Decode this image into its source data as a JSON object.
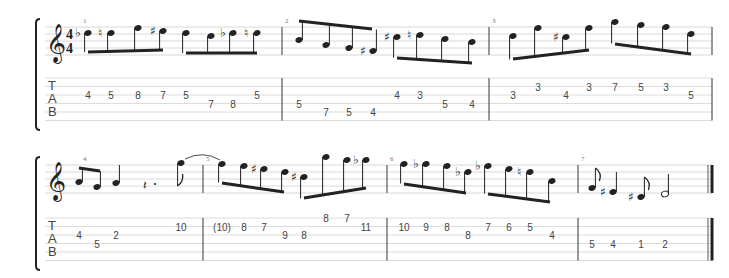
{
  "score": {
    "time_signature": {
      "top": "4",
      "bottom": "4"
    },
    "clef": "treble-clef",
    "tab_label": [
      "T",
      "A",
      "B"
    ],
    "systems": [
      {
        "measures": [
          {
            "number": "1",
            "tab": [
              {
                "fret": "4",
                "string": 2
              },
              {
                "fret": "5",
                "string": 2
              },
              {
                "fret": "8",
                "string": 2
              },
              {
                "fret": "7",
                "string": 2
              },
              {
                "fret": "5",
                "string": 2
              },
              {
                "fret": "7",
                "string": 3
              },
              {
                "fret": "8",
                "string": 3
              },
              {
                "fret": "5",
                "string": 2
              }
            ],
            "accidentals": [
              "♭",
              "♮",
              "",
              "♯",
              "",
              "",
              "♭",
              "♮"
            ]
          },
          {
            "number": "2",
            "tab": [
              {
                "fret": "5",
                "string": 3
              },
              {
                "fret": "7",
                "string": 4
              },
              {
                "fret": "5",
                "string": 4
              },
              {
                "fret": "4",
                "string": 4
              },
              {
                "fret": "4",
                "string": 2
              },
              {
                "fret": "3",
                "string": 2
              },
              {
                "fret": "5",
                "string": 3
              },
              {
                "fret": "4",
                "string": 3
              }
            ],
            "accidentals": [
              "",
              "",
              "",
              "♯",
              "♯",
              "♮",
              "",
              ""
            ]
          },
          {
            "number": "3",
            "tab": [
              {
                "fret": "3",
                "string": 2
              },
              {
                "fret": "3",
                "string": 1
              },
              {
                "fret": "4",
                "string": 2
              },
              {
                "fret": "3",
                "string": 1
              },
              {
                "fret": "7",
                "string": 1
              },
              {
                "fret": "5",
                "string": 1
              },
              {
                "fret": "3",
                "string": 1
              },
              {
                "fret": "5",
                "string": 2
              }
            ],
            "accidentals": [
              "",
              "",
              "♯",
              "",
              "",
              "",
              "",
              ""
            ]
          }
        ]
      },
      {
        "measures": [
          {
            "number": "4",
            "tab": [
              {
                "fret": "4",
                "string": 2
              },
              {
                "fret": "5",
                "string": 3
              },
              {
                "fret": "2",
                "string": 2
              },
              {
                "fret": "10",
                "string": 1
              }
            ],
            "accidentals": [
              "",
              "",
              "",
              ""
            ],
            "rest": "dotted-quarter-rest"
          },
          {
            "number": "5",
            "tab": [
              {
                "fret": "(10)",
                "string": 1
              },
              {
                "fret": "8",
                "string": 1
              },
              {
                "fret": "7",
                "string": 1
              },
              {
                "fret": "9",
                "string": 2
              },
              {
                "fret": "8",
                "string": 2
              },
              {
                "fret": "8",
                "string": 0
              },
              {
                "fret": "7",
                "string": 0
              },
              {
                "fret": "11",
                "string": 1
              }
            ],
            "accidentals": [
              "",
              "",
              "♯",
              "",
              "♯",
              "",
              "",
              "♭"
            ]
          },
          {
            "number": "6",
            "tab": [
              {
                "fret": "10",
                "string": 1
              },
              {
                "fret": "9",
                "string": 1
              },
              {
                "fret": "8",
                "string": 1
              },
              {
                "fret": "8",
                "string": 2
              },
              {
                "fret": "7",
                "string": 1
              },
              {
                "fret": "6",
                "string": 1
              },
              {
                "fret": "5",
                "string": 1
              },
              {
                "fret": "4",
                "string": 2
              }
            ],
            "accidentals": [
              "",
              "♭",
              "",
              "♭",
              "♭",
              "",
              "♮",
              ""
            ]
          },
          {
            "number": "7",
            "tab": [
              {
                "fret": "5",
                "string": 3
              },
              {
                "fret": "4",
                "string": 3
              },
              {
                "fret": "1",
                "string": 3
              },
              {
                "fret": "2",
                "string": 3
              }
            ],
            "accidentals": [
              "",
              "♯",
              "♯",
              ""
            ]
          }
        ]
      }
    ]
  }
}
